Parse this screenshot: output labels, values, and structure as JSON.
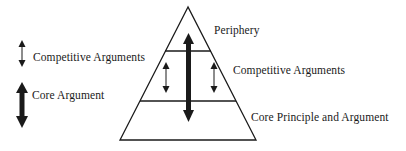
{
  "diagram": {
    "type": "pyramid",
    "legend": [
      {
        "icon": "thin-double-arrow-icon",
        "label": "Competitive Arguments"
      },
      {
        "icon": "thick-double-arrow-icon",
        "label": "Core Argument"
      }
    ],
    "layers": [
      {
        "position": "top",
        "label": "Periphery"
      },
      {
        "position": "middle",
        "label": "Competitive Arguments"
      },
      {
        "position": "bottom",
        "label": "Core Principle and Argument"
      }
    ],
    "colors": {
      "line": "#1a1a1a",
      "background": "#ffffff"
    }
  }
}
